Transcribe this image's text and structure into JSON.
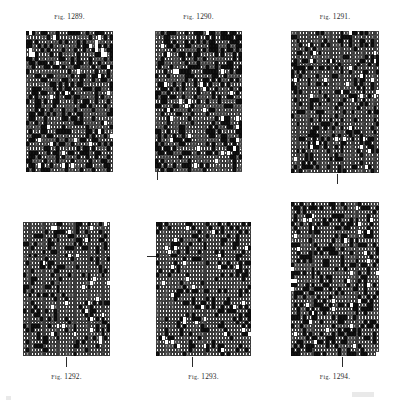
{
  "plate": {
    "title": "Point-paper weave design plate",
    "background_color": "#ffffff",
    "ink_color": "#151515",
    "figure_count": 6
  },
  "figures": [
    {
      "id": "fig-1289",
      "caption_prefix": "Fig.",
      "caption_number": "1289.",
      "caption_full": "Fig. 1289.",
      "caption_position": "above",
      "x": 26,
      "y": 31,
      "width": 87,
      "height": 141,
      "cols": 29,
      "rows": 33,
      "glyphs": [
        "x",
        "fill",
        "open"
      ],
      "density_percent": 62,
      "ticks": []
    },
    {
      "id": "fig-1290",
      "caption_prefix": "Fig.",
      "caption_number": "1290.",
      "caption_full": "Fig. 1290.",
      "caption_position": "above",
      "x": 155,
      "y": 31,
      "width": 87,
      "height": 141,
      "cols": 29,
      "rows": 33,
      "glyphs": [
        "x",
        "fill",
        "open"
      ],
      "density_percent": 60,
      "ticks": [
        {
          "orientation": "vertical",
          "x": 157,
          "y": 170,
          "length": 10
        }
      ]
    },
    {
      "id": "fig-1291",
      "caption_prefix": "Fig.",
      "caption_number": "1291.",
      "caption_full": "Fig. 1291.",
      "caption_position": "above",
      "x": 291,
      "y": 31,
      "width": 88,
      "height": 142,
      "cols": 32,
      "rows": 36,
      "glyphs": [
        "dot",
        "fill",
        "open"
      ],
      "density_percent": 46,
      "ticks": [
        {
          "orientation": "vertical",
          "x": 337,
          "y": 174,
          "length": 10
        }
      ]
    },
    {
      "id": "fig-1292",
      "caption_prefix": "Fig.",
      "caption_number": "1292.",
      "caption_full": "Fig. 1292.",
      "caption_position": "below",
      "x": 23,
      "y": 222,
      "width": 87,
      "height": 134,
      "cols": 31,
      "rows": 34,
      "glyphs": [
        "dot",
        "fill",
        "open"
      ],
      "density_percent": 38,
      "ticks": [
        {
          "orientation": "vertical",
          "x": 66,
          "y": 357,
          "length": 10
        }
      ]
    },
    {
      "id": "fig-1293",
      "caption_prefix": "Fig.",
      "caption_number": "1293.",
      "caption_full": "Fig. 1293.",
      "caption_position": "below",
      "x": 156,
      "y": 222,
      "width": 95,
      "height": 134,
      "cols": 32,
      "rows": 34,
      "glyphs": [
        "dot",
        "fill",
        "open"
      ],
      "density_percent": 40,
      "ticks": [
        {
          "orientation": "horizontal",
          "x": 147,
          "y": 256,
          "length": 9
        },
        {
          "orientation": "vertical",
          "x": 192,
          "y": 357,
          "length": 10
        }
      ]
    },
    {
      "id": "fig-1294",
      "caption_prefix": "Fig.",
      "caption_number": "1294.",
      "caption_full": "Fig. 1294.",
      "caption_position": "below",
      "x": 291,
      "y": 202,
      "width": 88,
      "height": 154,
      "cols": 30,
      "rows": 38,
      "glyphs": [
        "dot",
        "fill",
        "open"
      ],
      "density_percent": 55,
      "ticks": [
        {
          "orientation": "vertical",
          "x": 342,
          "y": 357,
          "length": 10
        }
      ]
    }
  ],
  "captions": [
    {
      "id": "cap-1289",
      "text": "1289.",
      "prefix": "Fig.",
      "x": 26,
      "y": 12,
      "width": 87
    },
    {
      "id": "cap-1290",
      "text": "1290.",
      "prefix": "Fig.",
      "x": 155,
      "y": 12,
      "width": 87
    },
    {
      "id": "cap-1291",
      "text": "1291.",
      "prefix": "Fig.",
      "x": 291,
      "y": 12,
      "width": 88
    },
    {
      "id": "cap-1292",
      "text": "1292.",
      "prefix": "Fig.",
      "x": 23,
      "y": 372,
      "width": 87
    },
    {
      "id": "cap-1293",
      "text": "1293.",
      "prefix": "Fig.",
      "x": 156,
      "y": 372,
      "width": 95
    },
    {
      "id": "cap-1294",
      "text": "1294.",
      "prefix": "Fig.",
      "x": 291,
      "y": 372,
      "width": 88
    }
  ]
}
